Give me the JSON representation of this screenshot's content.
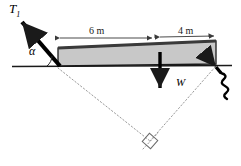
{
  "figure": {
    "name": "beam-with-cable-free-body-diagram",
    "background_color": "#ffffff",
    "labels": {
      "tension_symbol": "T",
      "tension_subscript": "1",
      "angle_symbol": "α",
      "weight_symbol": "W",
      "dimension_left": "6 m",
      "dimension_right": "4 m"
    },
    "colors": {
      "ink": "#000000",
      "beam_fill": "#c8c8c8",
      "beam_edge": "#1a1a1a",
      "beam_top_edge": "#3a3a3a",
      "dim_line": "#4a4a4a",
      "construction_line": "#9a9a9a",
      "ground_line": "#1a1a1a"
    },
    "elements": {
      "beam": "gray-rectangle-beam",
      "ground": "horizontal-ground-line",
      "cable_T1": "thick-arrow-up-left",
      "weight_arrow": "thick-arrow-down",
      "second-cable": "squiggly-arrow-up-left",
      "construction": "dotted-triangle-lines",
      "right_angle": "square-right-angle-marker"
    },
    "geometry": {
      "beam_left_x": 57,
      "beam_right_x": 215,
      "beam_top_y": 42,
      "beam_bottom_y": 65,
      "ground_y": 66,
      "split_x": 157,
      "apex_x": 150,
      "apex_y": 141
    }
  }
}
